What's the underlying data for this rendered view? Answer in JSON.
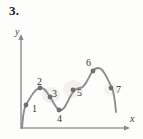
{
  "figure": {
    "problem_number": "3.",
    "axis_labels": {
      "x": "x",
      "y": "y"
    },
    "stroke_color": "#8d8d8d",
    "point_color": "#6f6f6f",
    "axis_color": "#9a9a9a",
    "text_color": "#333333"
  },
  "chart_data": {
    "type": "line",
    "title": "3.",
    "xlabel": "x",
    "ylabel": "y",
    "grid": false,
    "legend": null,
    "axis_origin": [
      21,
      128
    ],
    "xlim": [
      21,
      133
    ],
    "ylim": [
      35,
      128
    ],
    "series": [
      {
        "name": "curve",
        "description": "smooth wavy curve with two local maxima, one local minimum, and inflection points",
        "path": "M 22,128 C 23,118 23,110 26,105 C 31,96 35,89 40,88 C 45,87 47,93 50,97 C 53,101 55,107 59,110 C 63,112 66,105 70,97 C 73,91 76,88 80,88 C 85,88 88,78 92,72 C 95,68 98,67 101,69 C 105,72 108,80 112,88 C 114,93 115,100 116,112"
      }
    ],
    "points": [
      {
        "label": "1",
        "x": 26,
        "y": 105,
        "label_x": 32,
        "label_y": 104,
        "kind": "inflection"
      },
      {
        "label": "2",
        "x": 40,
        "y": 88,
        "label_x": 37,
        "label_y": 77,
        "kind": "local-maximum"
      },
      {
        "label": "3",
        "x": 50,
        "y": 97,
        "label_x": 52,
        "label_y": 89,
        "kind": "inflection"
      },
      {
        "label": "4",
        "x": 59,
        "y": 110,
        "label_x": 57,
        "label_y": 114,
        "kind": "local-minimum"
      },
      {
        "label": "5",
        "x": 73,
        "y": 90,
        "label_x": 77,
        "label_y": 88,
        "kind": "inflection"
      },
      {
        "label": "6",
        "x": 93,
        "y": 71,
        "label_x": 86,
        "label_y": 58,
        "kind": "local-maximum"
      },
      {
        "label": "7",
        "x": 111,
        "y": 88,
        "label_x": 116,
        "label_y": 85,
        "kind": "inflection"
      }
    ]
  }
}
